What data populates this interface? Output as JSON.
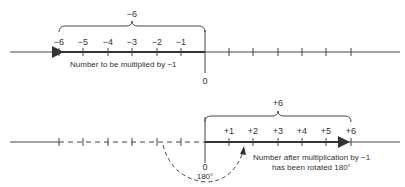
{
  "top": {
    "brace_label": "−6",
    "tick_labels": [
      "−6",
      "−5",
      "−4",
      "−3",
      "−2",
      "−1"
    ],
    "zero_label": "0",
    "caption": "Number to be multiplied by −1"
  },
  "bottom": {
    "brace_label": "+6",
    "tick_labels": [
      "+1",
      "+2",
      "+3",
      "+4",
      "+5",
      "+6"
    ],
    "zero_label": "0",
    "angle_label": "180°",
    "caption_line1": "Number after multiplication by −1",
    "caption_line2": "has been rotated 180°"
  },
  "colors": {
    "ink": "#333333",
    "background": "#ffffff"
  }
}
